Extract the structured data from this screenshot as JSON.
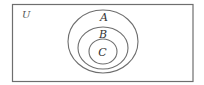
{
  "diagram": {
    "type": "venn-nested-subsets",
    "stroke_color": "#6e6e6e",
    "background": "#ffffff",
    "universe": {
      "label": "U",
      "rect": {
        "x": 12.5,
        "y": 4.5,
        "width": 180.5,
        "height": 77
      }
    },
    "sets": [
      {
        "label": "A",
        "cx": 103,
        "cy": 41.5,
        "rx": 35,
        "ry": 31.5,
        "label_x": 104,
        "label_y": 21
      },
      {
        "label": "B",
        "cx": 103,
        "cy": 48,
        "rx": 25,
        "ry": 21,
        "label_x": 103,
        "label_y": 37.5
      },
      {
        "label": "C",
        "cx": 103,
        "cy": 51.5,
        "rx": 14,
        "ry": 12.5,
        "label_x": 102.5,
        "label_y": 56
      }
    ],
    "relationships": [
      "C ⊂ B",
      "B ⊂ A",
      "A ⊂ U"
    ]
  }
}
